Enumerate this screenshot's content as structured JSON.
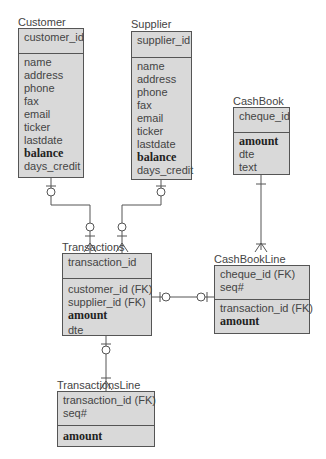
{
  "diagram": {
    "type": "entity-relationship",
    "entities": [
      {
        "id": "customer",
        "name": "Customer",
        "key_attributes": [
          {
            "name": "customer_id",
            "bold": false
          }
        ],
        "attributes": [
          {
            "name": "name",
            "bold": false
          },
          {
            "name": "address",
            "bold": false
          },
          {
            "name": "phone",
            "bold": false
          },
          {
            "name": "fax",
            "bold": false
          },
          {
            "name": "email",
            "bold": false
          },
          {
            "name": "ticker",
            "bold": false
          },
          {
            "name": "lastdate",
            "bold": false
          },
          {
            "name": "balance",
            "bold": true
          },
          {
            "name": "days_credit",
            "bold": false
          }
        ]
      },
      {
        "id": "supplier",
        "name": "Supplier",
        "key_attributes": [
          {
            "name": "supplier_id",
            "bold": false
          }
        ],
        "attributes": [
          {
            "name": "name",
            "bold": false
          },
          {
            "name": "address",
            "bold": false
          },
          {
            "name": "phone",
            "bold": false
          },
          {
            "name": "fax",
            "bold": false
          },
          {
            "name": "email",
            "bold": false
          },
          {
            "name": "ticker",
            "bold": false
          },
          {
            "name": "lastdate",
            "bold": false
          },
          {
            "name": "balance",
            "bold": true
          },
          {
            "name": "days_credit",
            "bold": false
          }
        ]
      },
      {
        "id": "cashbook",
        "name": "CashBook",
        "key_attributes": [
          {
            "name": "cheque_id",
            "bold": false
          }
        ],
        "attributes": [
          {
            "name": "amount",
            "bold": true
          },
          {
            "name": "dte",
            "bold": false
          },
          {
            "name": "text",
            "bold": false
          }
        ]
      },
      {
        "id": "transactions",
        "name": "Transactions",
        "key_attributes": [
          {
            "name": "transaction_id",
            "bold": false
          }
        ],
        "attributes": [
          {
            "name": "customer_id (FK)",
            "bold": false
          },
          {
            "name": "supplier_id (FK)",
            "bold": false
          },
          {
            "name": "amount",
            "bold": true
          },
          {
            "name": "dte",
            "bold": false
          }
        ]
      },
      {
        "id": "cashbookline",
        "name": "CashBookLine",
        "key_attributes": [
          {
            "name": "cheque_id (FK)",
            "bold": false
          },
          {
            "name": "seq#",
            "bold": false
          }
        ],
        "attributes": [
          {
            "name": "transaction_id (FK)",
            "bold": false
          },
          {
            "name": "amount",
            "bold": true
          }
        ]
      },
      {
        "id": "transactionsline",
        "name": "TransactionsLine",
        "key_attributes": [
          {
            "name": "transaction_id (FK)",
            "bold": false
          },
          {
            "name": "seq#",
            "bold": false
          }
        ],
        "attributes": [
          {
            "name": "amount",
            "bold": true
          }
        ]
      }
    ],
    "relationships": [
      {
        "from": "Customer",
        "to": "Transactions",
        "from_card": "zero-or-one",
        "to_card": "zero-or-many"
      },
      {
        "from": "Supplier",
        "to": "Transactions",
        "from_card": "zero-or-one",
        "to_card": "zero-or-many"
      },
      {
        "from": "CashBook",
        "to": "CashBookLine",
        "from_card": "one",
        "to_card": "one-or-many"
      },
      {
        "from": "Transactions",
        "to": "CashBookLine",
        "from_card": "zero-or-one",
        "to_card": "zero-or-one"
      },
      {
        "from": "Transactions",
        "to": "TransactionsLine",
        "from_card": "zero-or-one",
        "to_card": "one-or-many"
      }
    ]
  },
  "colors": {
    "entity_fill": "#d9d9d9",
    "border": "#555555",
    "text": "#444444"
  }
}
